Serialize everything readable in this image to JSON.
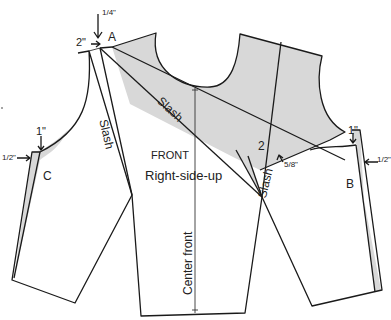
{
  "diagram": {
    "type": "sewing-pattern",
    "piece_label": "FRONT",
    "orientation_label": "Right-side-up",
    "center_line_label": "Center front",
    "slash_labels": [
      "Slash",
      "Slash",
      "Slash"
    ],
    "points": {
      "a": "A",
      "b": "B",
      "c": "C",
      "two": "2"
    },
    "measurements": {
      "top_quarter": "1/4\"",
      "top_two": "2\"",
      "left_one": "1\"",
      "left_half": "1/2\"",
      "right_one": "1\"",
      "right_half": "1/2\"",
      "five_eighths": "5/8\""
    },
    "colors": {
      "line": "#1a1a1a",
      "shade": "#d8d8d8",
      "background": "#ffffff"
    }
  }
}
